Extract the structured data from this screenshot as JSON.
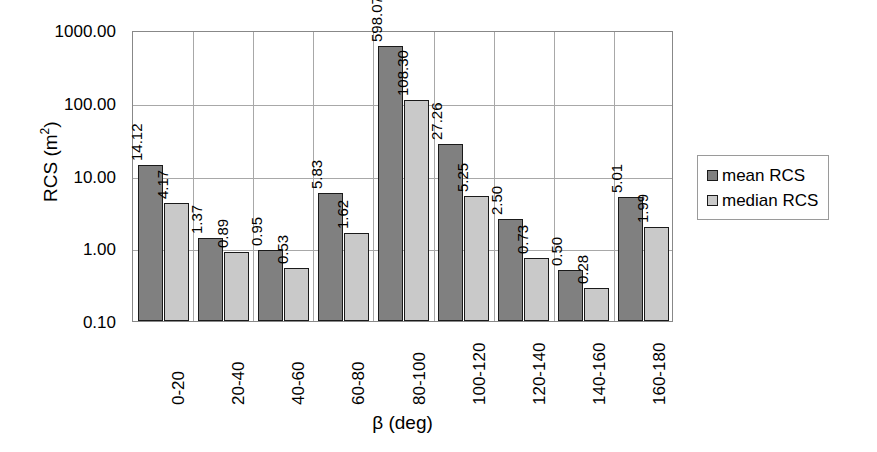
{
  "chart_data": {
    "type": "bar",
    "title": "",
    "xlabel": "β (deg)",
    "ylabel": "RCS (m²)",
    "ylabel_base": "RCS (m",
    "ylabel_sup": "2",
    "ylabel_tail": ")",
    "yscale": "log",
    "ylim": [
      0.1,
      1000.0
    ],
    "grid": true,
    "legend_position": "right",
    "categories": [
      "0-20",
      "20-40",
      "40-60",
      "60-80",
      "80-100",
      "100-120",
      "120-140",
      "140-160",
      "160-180"
    ],
    "ytick_labels": [
      "1000.00",
      "100.00",
      "10.00",
      "1.00",
      "0.10"
    ],
    "ytick_values": [
      1000,
      100,
      10,
      1,
      0.1
    ],
    "series": [
      {
        "name": "mean RCS",
        "color": "#808080",
        "values": [
          14.12,
          1.37,
          0.95,
          5.83,
          598.07,
          27.26,
          2.5,
          0.5,
          5.01
        ],
        "labels": [
          "14.12",
          "1.37",
          "0.95",
          "5.83",
          "598.07",
          "27.26",
          "2.50",
          "0.50",
          "5.01"
        ]
      },
      {
        "name": "median RCS",
        "color": "#c9c9c9",
        "values": [
          4.17,
          0.89,
          0.53,
          1.62,
          108.3,
          5.25,
          0.73,
          0.28,
          1.99
        ],
        "labels": [
          "4.17",
          "0.89",
          "0.53",
          "1.62",
          "108.30",
          "5.25",
          "0.73",
          "0.28",
          "1.99"
        ]
      }
    ]
  },
  "legend": {
    "items": [
      {
        "label": "mean RCS"
      },
      {
        "label": "median RCS"
      }
    ]
  }
}
